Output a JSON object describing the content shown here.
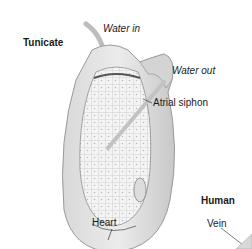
{
  "diagram": {
    "sections": [
      {
        "id": "tunicate",
        "title": "Tunicate"
      },
      {
        "id": "human",
        "title": "Human"
      }
    ],
    "labels": {
      "water_in": "Water in",
      "water_out": "Water out",
      "atrial_siphon": "Atrial siphon",
      "heart": "Heart",
      "vein": "Vein"
    }
  }
}
